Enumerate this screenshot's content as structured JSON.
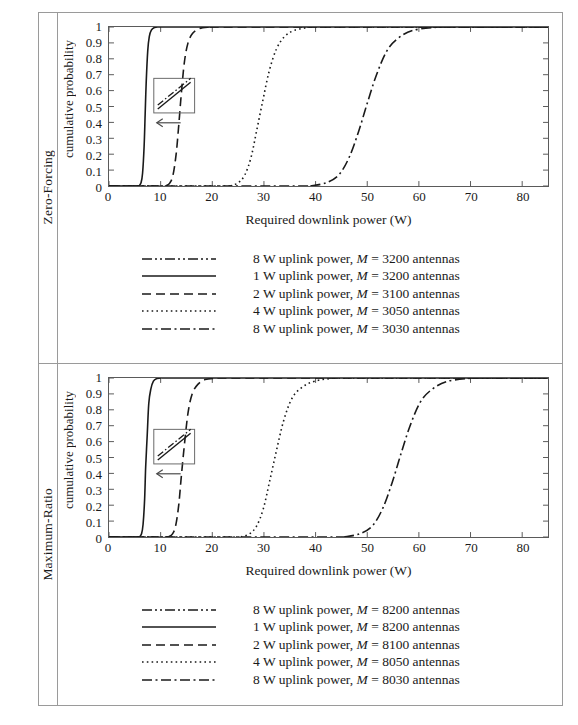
{
  "figure": {
    "panels": [
      {
        "row_label": "Zero-Forcing",
        "axis": {
          "xlabel": "Required downlink power (W)",
          "ylabel": "cumulative probability",
          "xticks": [
            "0",
            "10",
            "20",
            "30",
            "40",
            "50",
            "60",
            "70",
            "80"
          ],
          "yticks": [
            "1",
            "0.9",
            "0.8",
            "0.7",
            "0.6",
            "0.5",
            "0.4",
            "0.3",
            "0.2",
            "0.1",
            "0"
          ]
        },
        "legend": [
          {
            "style": "dashdotdot",
            "label": "8 W uplink power, M = 3200 antennas"
          },
          {
            "style": "solid",
            "label": "1 W uplink power, M = 3200 antennas"
          },
          {
            "style": "dashed",
            "label": "2 W uplink power, M = 3100 antennas"
          },
          {
            "style": "dotted",
            "label": "4 W uplink power, M = 3050 antennas"
          },
          {
            "style": "dashdot",
            "label": "8 W uplink power, M = 3030 antennas"
          }
        ]
      },
      {
        "row_label": "Maximum-Ratio",
        "axis": {
          "xlabel": "Required downlink power (W)",
          "ylabel": "cumulative probability",
          "xticks": [
            "0",
            "10",
            "20",
            "30",
            "40",
            "50",
            "60",
            "70",
            "80"
          ],
          "yticks": [
            "1",
            "0.9",
            "0.8",
            "0.7",
            "0.6",
            "0.5",
            "0.4",
            "0.3",
            "0.2",
            "0.1",
            "0"
          ]
        },
        "legend": [
          {
            "style": "dashdotdot",
            "label": "8 W uplink power, M = 8200 antennas"
          },
          {
            "style": "solid",
            "label": "1 W uplink power, M = 8200 antennas"
          },
          {
            "style": "dashed",
            "label": "2 W uplink power, M = 8100 antennas"
          },
          {
            "style": "dotted",
            "label": "4 W uplink power, M = 8050 antennas"
          },
          {
            "style": "dashdot",
            "label": "8 W uplink power, M = 8030 antennas"
          }
        ]
      }
    ]
  },
  "chart_data": [
    {
      "type": "line",
      "title": "Zero-Forcing",
      "xlabel": "Required downlink power (W)",
      "ylabel": "cumulative probability",
      "xlim": [
        0,
        85
      ],
      "ylim": [
        0,
        1
      ],
      "xticks": [
        0,
        10,
        20,
        30,
        40,
        50,
        60,
        70,
        80
      ],
      "yticks": [
        0,
        0.1,
        0.2,
        0.3,
        0.4,
        0.5,
        0.6,
        0.7,
        0.8,
        0.9,
        1
      ],
      "grid": false,
      "legend_position": "below",
      "annotation": "inset box with arrow pointing left, indicating increasing uplink power shifts CDF left",
      "series": [
        {
          "name": "1 W uplink power, M = 3200 antennas",
          "style": "solid",
          "x": [
            5.8,
            6.2,
            6.5,
            6.8,
            7.0,
            7.2,
            7.5,
            7.8,
            8.2,
            8.8,
            9.5
          ],
          "y": [
            0.0,
            0.02,
            0.08,
            0.25,
            0.45,
            0.65,
            0.85,
            0.94,
            0.98,
            0.997,
            1.0
          ]
        },
        {
          "name": "2 W uplink power, M = 3100 antennas",
          "style": "dashed",
          "x": [
            11.0,
            11.8,
            12.4,
            13.0,
            13.5,
            14.0,
            14.6,
            15.3,
            16.2,
            17.5,
            19.5
          ],
          "y": [
            0.0,
            0.02,
            0.07,
            0.2,
            0.38,
            0.58,
            0.78,
            0.9,
            0.96,
            0.99,
            1.0
          ]
        },
        {
          "name": "4 W uplink power, M = 3050 antennas",
          "style": "dotted",
          "x": [
            23.5,
            25.0,
            26.3,
            27.5,
            28.6,
            29.8,
            31.0,
            32.4,
            34.0,
            36.0,
            39.0
          ],
          "y": [
            0.0,
            0.02,
            0.07,
            0.18,
            0.35,
            0.54,
            0.72,
            0.86,
            0.94,
            0.98,
            1.0
          ]
        },
        {
          "name": "8 W uplink power, M = 3030 antennas",
          "style": "dashdot",
          "x": [
            39.0,
            42.0,
            44.5,
            46.5,
            48.3,
            50.0,
            51.8,
            53.8,
            56.0,
            59.0,
            64.0
          ],
          "y": [
            0.0,
            0.02,
            0.07,
            0.18,
            0.34,
            0.52,
            0.7,
            0.85,
            0.93,
            0.98,
            1.0
          ]
        }
      ]
    },
    {
      "type": "line",
      "title": "Maximum-Ratio",
      "xlabel": "Required downlink power (W)",
      "ylabel": "cumulative probability",
      "xlim": [
        0,
        85
      ],
      "ylim": [
        0,
        1
      ],
      "xticks": [
        0,
        10,
        20,
        30,
        40,
        50,
        60,
        70,
        80
      ],
      "yticks": [
        0,
        0.1,
        0.2,
        0.3,
        0.4,
        0.5,
        0.6,
        0.7,
        0.8,
        0.9,
        1
      ],
      "grid": false,
      "legend_position": "below",
      "annotation": "inset box with arrow pointing left, indicating increasing uplink power shifts CDF left",
      "series": [
        {
          "name": "1 W uplink power, M = 8200 antennas",
          "style": "solid",
          "x": [
            5.9,
            6.3,
            6.6,
            6.9,
            7.1,
            7.4,
            7.7,
            8.1,
            8.6,
            9.3,
            10.2
          ],
          "y": [
            0.0,
            0.02,
            0.08,
            0.24,
            0.44,
            0.64,
            0.84,
            0.93,
            0.98,
            0.997,
            1.0
          ]
        },
        {
          "name": "2 W uplink power, M = 8100 antennas",
          "style": "dashed",
          "x": [
            11.5,
            12.3,
            12.9,
            13.5,
            14.0,
            14.6,
            15.3,
            16.1,
            17.2,
            18.6,
            21.0
          ],
          "y": [
            0.0,
            0.02,
            0.07,
            0.2,
            0.38,
            0.58,
            0.78,
            0.9,
            0.96,
            0.99,
            1.0
          ]
        },
        {
          "name": "4 W uplink power, M = 8050 antennas",
          "style": "dotted",
          "x": [
            25.5,
            27.2,
            28.6,
            29.9,
            31.1,
            32.4,
            33.8,
            35.4,
            37.3,
            39.8,
            43.5
          ],
          "y": [
            0.0,
            0.02,
            0.07,
            0.18,
            0.35,
            0.54,
            0.73,
            0.87,
            0.94,
            0.98,
            1.0
          ]
        },
        {
          "name": "8 W uplink power, M = 8030 antennas",
          "style": "dashdot",
          "x": [
            45.5,
            48.5,
            51.0,
            53.0,
            54.8,
            56.5,
            58.3,
            60.3,
            62.6,
            65.6,
            70.5
          ],
          "y": [
            0.0,
            0.02,
            0.07,
            0.18,
            0.34,
            0.52,
            0.7,
            0.85,
            0.93,
            0.98,
            1.0
          ]
        }
      ]
    }
  ]
}
